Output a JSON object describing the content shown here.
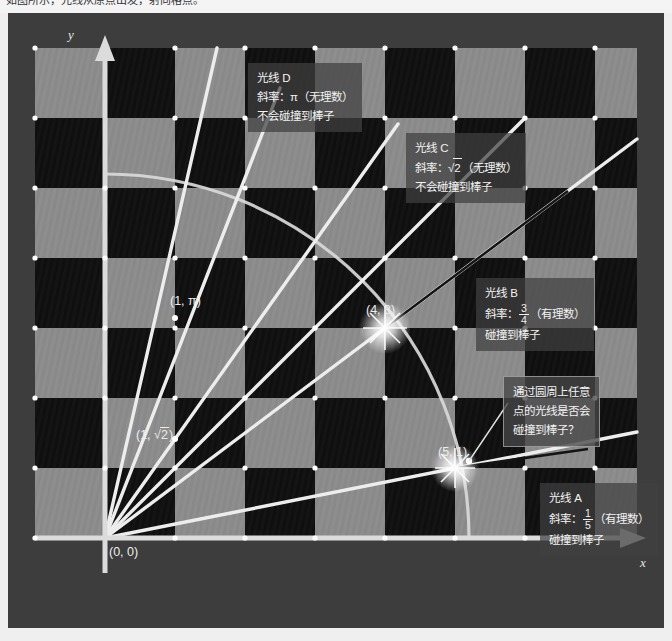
{
  "page": {
    "cut_top_text": "如图所示，光线从原点出发，射向格点。",
    "bg_color": "#f1f1f1",
    "frame_color": "#3d3d3d",
    "light_tile": "#8c8c8c",
    "dark_tile": "#111111",
    "axis_color": "#d8d8d8",
    "ray_color": "#e8e8e8",
    "dot_color": "#ffffff"
  },
  "axes": {
    "x_label": "x",
    "y_label": "y",
    "origin_label": "(0, 0)",
    "x_cells": 8,
    "y_cells": 8,
    "cell_px": 70
  },
  "points": [
    {
      "name": "origin",
      "label": "(0, 0)",
      "x": 0,
      "y": 0
    },
    {
      "name": "point-4-3",
      "label": "(4, 3)",
      "x": 4,
      "y": 3,
      "star": true
    },
    {
      "name": "point-5-1",
      "label": "(5, 1)",
      "x": 5,
      "y": 1,
      "star": true
    },
    {
      "name": "point-1-pi",
      "label": "(1, π)",
      "x": 1,
      "y": 3.14159
    },
    {
      "name": "point-1-sqrt2",
      "label_pre": "(1, ",
      "label_rad": "2",
      "label_post": ")",
      "x": 1,
      "y": 1.41421
    }
  ],
  "rays": [
    {
      "id": "A",
      "slope_num": "1",
      "slope_den": "5",
      "kind": "有理数",
      "hits": true
    },
    {
      "id": "B",
      "slope_num": "3",
      "slope_den": "4",
      "kind": "有理数",
      "hits": true
    },
    {
      "id": "C",
      "slope_text": "√2",
      "kind": "无理数",
      "hits": false
    },
    {
      "id": "D",
      "slope_text": "π",
      "kind": "无理数",
      "hits": false
    }
  ],
  "annotations": {
    "ray_d": {
      "title": "光线 D",
      "slope_prefix": "斜率：",
      "slope_value": "π",
      "slope_suffix": "（无理数）",
      "result": "不会碰撞到棒子"
    },
    "ray_c": {
      "title": "光线 C",
      "slope_prefix": "斜率：",
      "slope_radicand": "2",
      "slope_suffix": "（无理数）",
      "result": "不会碰撞到棒子"
    },
    "ray_b": {
      "title": "光线 B",
      "slope_prefix": "斜率：",
      "slope_num": "3",
      "slope_den": "4",
      "slope_suffix": "（有理数）",
      "result": "碰撞到棒子"
    },
    "ray_a": {
      "title": "光线 A",
      "slope_prefix": "斜率：",
      "slope_num": "1",
      "slope_den": "5",
      "slope_suffix": "（有理数）",
      "result": "碰撞到棒子"
    },
    "circle_question": {
      "line1": "通过圆周上任意",
      "line2": "点的光线是否会",
      "line3": "碰撞到棒子？"
    }
  }
}
